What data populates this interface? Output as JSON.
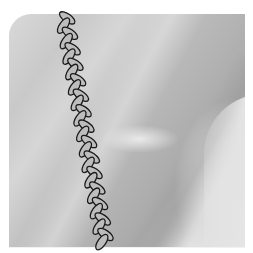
{
  "image": {
    "description": "Grayscale textured surface with a diagonal braided chain of overlapping ellipses",
    "colors": {
      "background_light": "#e6e6e6",
      "background_mid": "#c4c4c4",
      "background_dark": "#a9a9a9",
      "braid_fill": "#bdbdbd",
      "braid_stroke": "#1a1a1a",
      "page": "#ffffff"
    },
    "braid": {
      "start": [
        64,
        14
      ],
      "end": [
        105,
        246
      ],
      "link_count": 30
    }
  }
}
